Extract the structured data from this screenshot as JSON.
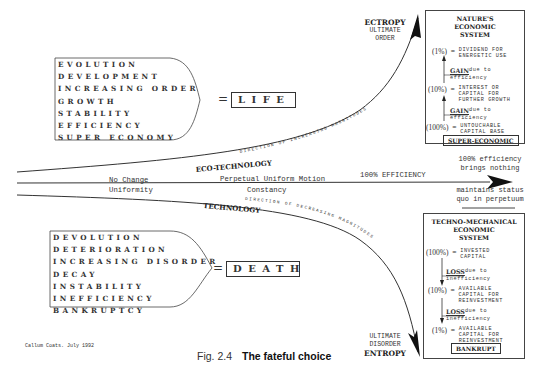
{
  "figure": {
    "caption_number": "Fig. 2.4",
    "caption_title": "The fateful choice",
    "credit": "Callum Coats.  July 1992"
  },
  "life_group": {
    "items": [
      "EVOLUTION",
      "DEVELOPMENT",
      "INCREASING ORDER",
      "GROWTH",
      "STABILITY",
      "EFFICIENCY",
      "SUPER ECONOMY"
    ],
    "equals": "=",
    "result": "LIFE"
  },
  "death_group": {
    "items": [
      "DEVOLUTION",
      "DETERIORATION",
      "INCREASING DISORDER",
      "DECAY",
      "INSTABILITY",
      "INEFFICIENCY",
      "BANKRUPTCY"
    ],
    "equals": "=",
    "result": "DEATH"
  },
  "upper_path": {
    "label": "ECO-TECHNOLOGY",
    "direction_text": "DIRECTION OF INCREASING MAGNITUDES",
    "end_heading": "ECTROPY",
    "end_sub1": "ULTIMATE",
    "end_sub2": "ORDER"
  },
  "middle_path": {
    "left_label1": "No Change",
    "left_label2": "Uniformity",
    "mid_label1": "Perpetual Uniform Motion",
    "mid_label2": "Constancy",
    "right_label": "100% EFFICIENCY",
    "end_note_top1": "100% efficiency",
    "end_note_top2": "brings nothing",
    "end_note_bottom1": "maintains status",
    "end_note_bottom2": "quo in perpetuum"
  },
  "lower_path": {
    "label": "TECHNOLOGY",
    "direction_text": "DIRECTION OF DECREASING MAGNITUDES",
    "end_heading": "ENTROPY",
    "end_sub1": "ULTIMATE",
    "end_sub2": "DISORDER"
  },
  "nature_box": {
    "title_lines": [
      "NATURE'S",
      "ECONOMIC",
      "SYSTEM"
    ],
    "rows": [
      {
        "pct": "(1%)",
        "eq": "=",
        "text1": "DIVIDEND FOR",
        "text2": "ENERGETIC USE"
      },
      {
        "pct": "(10%)",
        "eq": "=",
        "text1": "INTEREST OR",
        "text2": "CAPITAL FOR",
        "text3": "FURTHER GROWTH"
      },
      {
        "pct": "(100%)",
        "eq": "=",
        "text1": "UNTOUCHABLE",
        "text2": "CAPITAL BASE"
      }
    ],
    "steps": [
      {
        "word": "GAIN",
        "rest": " due to",
        "line2": "efficiency"
      },
      {
        "word": "GAIN",
        "rest": " due to",
        "line2": "efficiency"
      }
    ],
    "tag": "SUPER-ECONOMIC"
  },
  "techno_box": {
    "title_lines": [
      "TECHNO-MECHANICAL",
      "ECONOMIC",
      "SYSTEM"
    ],
    "rows": [
      {
        "pct": "(100%)",
        "eq": "=",
        "text1": "INVESTED",
        "text2": "CAPITAL"
      },
      {
        "pct": "(10%)",
        "eq": "=",
        "text1": "AVAILABLE",
        "text2": "CAPITAL FOR",
        "text3": "REINVESTMENT"
      },
      {
        "pct": "(1%)",
        "eq": "=",
        "text1": "AVAILABLE",
        "text2": "CAPITAL FOR",
        "text3": "REINVESTMENT"
      }
    ],
    "steps": [
      {
        "word": "LOSS",
        "rest": " due to",
        "line2": "inefficiency"
      },
      {
        "word": "LOSS",
        "rest": " due to",
        "line2": "inefficiency"
      }
    ],
    "tag": "BANKRUPT"
  }
}
